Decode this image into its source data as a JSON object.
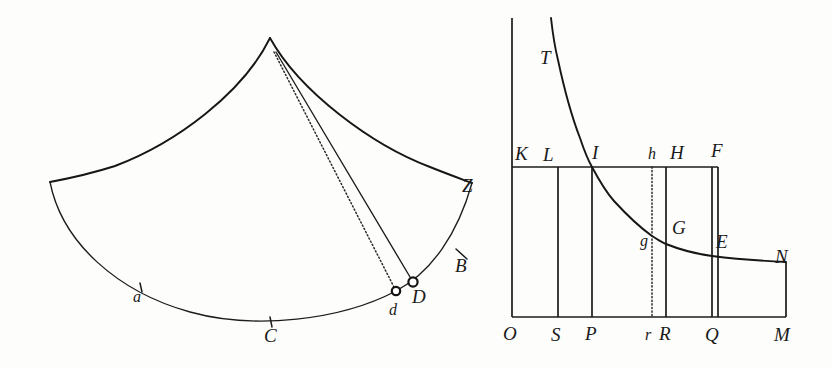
{
  "plate": {
    "width": 832,
    "height": 367,
    "background_color": "#fdfdfc",
    "ink_color": "#161616"
  },
  "figures": [
    {
      "id": "left-figure",
      "name": "sector-trajectory-figure",
      "description": "Curvilinear sector with apex, concave bounding arcs and two radial lines to points d and D",
      "labels": [
        {
          "key": "a",
          "text": "a",
          "x": 133,
          "y": 302,
          "style": "italic-small",
          "has_tick": true,
          "tick_x": 141,
          "tick_y": 286
        },
        {
          "key": "C",
          "text": "C",
          "x": 264,
          "y": 342,
          "style": "italic",
          "has_tick": true,
          "tick_x": 271,
          "tick_y": 322
        },
        {
          "key": "d",
          "text": "d",
          "x": 389,
          "y": 315,
          "style": "italic-small",
          "has_tick": false
        },
        {
          "key": "D",
          "text": "D",
          "x": 412,
          "y": 303,
          "style": "italic",
          "has_tick": false
        },
        {
          "key": "B",
          "text": "B",
          "x": 455,
          "y": 272,
          "style": "italic",
          "has_tick": true,
          "tick_x": 461,
          "tick_y": 253
        },
        {
          "key": "Z",
          "text": "Z",
          "x": 462,
          "y": 192,
          "style": "italic",
          "has_tick": false
        }
      ],
      "points": [
        {
          "key": "apex",
          "x": 270,
          "y": 38
        },
        {
          "key": "left_corner",
          "x": 50,
          "y": 182
        },
        {
          "key": "d",
          "x": 396,
          "y": 291
        },
        {
          "key": "D",
          "x": 413,
          "y": 282
        },
        {
          "key": "Z_corner",
          "x": 472,
          "y": 183
        }
      ]
    },
    {
      "id": "right-figure",
      "name": "hyperbola-rectangles-figure",
      "description": "Rectangular hyperbola above a base axis with inscribed rectangles used for area comparison",
      "top_labels": [
        {
          "key": "T",
          "text": "T",
          "x": 540,
          "y": 64
        },
        {
          "key": "K",
          "text": "K",
          "x": 515,
          "y": 160
        },
        {
          "key": "L",
          "text": "L",
          "x": 543,
          "y": 161
        },
        {
          "key": "I",
          "text": "I",
          "x": 592,
          "y": 159
        },
        {
          "key": "h",
          "text": "h",
          "x": 652,
          "y": 159
        },
        {
          "key": "H",
          "text": "H",
          "x": 673,
          "y": 159
        },
        {
          "key": "F",
          "text": "F",
          "x": 713,
          "y": 157
        }
      ],
      "curve_labels": [
        {
          "key": "g",
          "text": "g",
          "x": 644,
          "y": 243
        },
        {
          "key": "G",
          "text": "G",
          "x": 676,
          "y": 232
        },
        {
          "key": "E",
          "text": "E",
          "x": 716,
          "y": 246
        },
        {
          "key": "N",
          "text": "N",
          "x": 777,
          "y": 262
        }
      ],
      "axis_labels": [
        {
          "key": "O",
          "text": "O",
          "x": 506,
          "y": 339
        },
        {
          "key": "S",
          "text": "S",
          "x": 553,
          "y": 340
        },
        {
          "key": "P",
          "text": "P",
          "x": 587,
          "y": 339
        },
        {
          "key": "r",
          "text": "r",
          "x": 648,
          "y": 339
        },
        {
          "key": "R",
          "text": "R",
          "x": 662,
          "y": 339
        },
        {
          "key": "Q",
          "text": "Q",
          "x": 707,
          "y": 340
        },
        {
          "key": "M",
          "text": "M",
          "x": 778,
          "y": 340
        }
      ],
      "geometry": {
        "baseline_y": 317,
        "rule_y": 167,
        "axis_top_y": 18,
        "verticals": [
          {
            "key": "O",
            "x": 512,
            "top": 18,
            "bottom": 317,
            "style": "solid"
          },
          {
            "key": "S",
            "x": 558,
            "top": 167,
            "bottom": 317,
            "style": "solid"
          },
          {
            "key": "P",
            "x": 592,
            "top": 167,
            "bottom": 317,
            "style": "solid"
          },
          {
            "key": "r",
            "x": 652,
            "top": 167,
            "bottom": 317,
            "style": "dotted"
          },
          {
            "key": "R",
            "x": 666,
            "top": 167,
            "bottom": 317,
            "style": "solid"
          },
          {
            "key": "Q",
            "x": 712,
            "top": 167,
            "bottom": 317,
            "style": "solid"
          },
          {
            "key": "M",
            "x": 786,
            "top": 262,
            "bottom": 317,
            "style": "solid"
          }
        ],
        "hyperbola_label": "TIgGEN",
        "hyperbola_points": [
          {
            "x": 551,
            "y": 18
          },
          {
            "x": 558,
            "y": 60
          },
          {
            "x": 570,
            "y": 106
          },
          {
            "x": 580,
            "y": 136
          },
          {
            "x": 592,
            "y": 167
          },
          {
            "x": 610,
            "y": 197
          },
          {
            "x": 630,
            "y": 219
          },
          {
            "x": 652,
            "y": 236
          },
          {
            "x": 666,
            "y": 244
          },
          {
            "x": 690,
            "y": 252
          },
          {
            "x": 712,
            "y": 256
          },
          {
            "x": 745,
            "y": 260
          },
          {
            "x": 786,
            "y": 262
          }
        ]
      }
    }
  ]
}
